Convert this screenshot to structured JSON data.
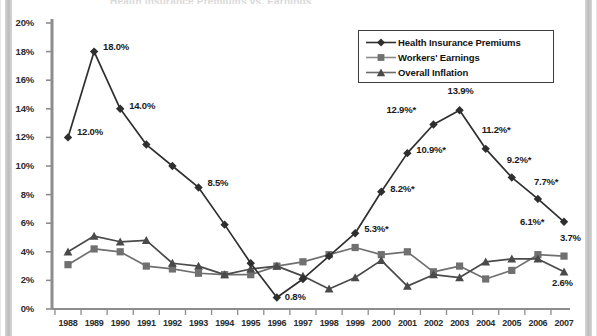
{
  "chart_data": {
    "type": "line",
    "title": "",
    "xlabel": "",
    "ylabel": "",
    "ylim": [
      0,
      20
    ],
    "ytick_labels": [
      "0%",
      "2%",
      "4%",
      "6%",
      "8%",
      "10%",
      "12%",
      "14%",
      "16%",
      "18%",
      "20%"
    ],
    "ytick_values": [
      0,
      2,
      4,
      6,
      8,
      10,
      12,
      14,
      16,
      18,
      20
    ],
    "grid": false,
    "legend_position": "top-right",
    "categories": [
      "1988",
      "1989",
      "1990",
      "1991",
      "1992",
      "1993",
      "1994",
      "1995",
      "1996",
      "1997",
      "1998",
      "1999",
      "2000",
      "2001",
      "2002",
      "2003",
      "2004",
      "2005",
      "2006",
      "2007"
    ],
    "series": [
      {
        "name": "Health Insurance Premiums",
        "marker": "diamond",
        "color": "#2f2f2f",
        "values": [
          12.0,
          18.0,
          14.0,
          11.5,
          10.0,
          8.5,
          5.9,
          3.2,
          0.8,
          2.1,
          3.7,
          5.3,
          8.2,
          10.9,
          12.9,
          13.9,
          11.2,
          9.2,
          7.7,
          6.1
        ],
        "labels": [
          {
            "x": "1988",
            "text": "12.0%"
          },
          {
            "x": "1989",
            "text": "18.0%"
          },
          {
            "x": "1990",
            "text": "14.0%"
          },
          {
            "x": "1993",
            "text": "8.5%"
          },
          {
            "x": "1996",
            "text": "0.8%"
          },
          {
            "x": "1999",
            "text": "5.3%*"
          },
          {
            "x": "2000",
            "text": "8.2%*"
          },
          {
            "x": "2001",
            "text": "10.9%*"
          },
          {
            "x": "2002",
            "text": "12.9%*"
          },
          {
            "x": "2003",
            "text": "13.9%"
          },
          {
            "x": "2004",
            "text": "11.2%*"
          },
          {
            "x": "2005",
            "text": "9.2%*"
          },
          {
            "x": "2006",
            "text": "7.7%*"
          },
          {
            "x": "2007",
            "text": "6.1%*"
          }
        ]
      },
      {
        "name": "Workers' Earnings",
        "marker": "square",
        "color": "#707070",
        "values": [
          3.1,
          4.2,
          4.0,
          3.0,
          2.8,
          2.5,
          2.4,
          2.4,
          3.0,
          3.3,
          3.8,
          4.3,
          3.8,
          4.0,
          2.6,
          3.0,
          2.1,
          2.7,
          3.8,
          3.7
        ],
        "labels": [
          {
            "x": "2007",
            "text": "3.7%"
          }
        ]
      },
      {
        "name": "Overall Inflation",
        "marker": "triangle",
        "color": "#4a4a4a",
        "values": [
          4.0,
          5.1,
          4.7,
          4.8,
          3.2,
          3.0,
          2.4,
          2.8,
          3.0,
          2.3,
          1.4,
          2.2,
          3.4,
          1.6,
          2.4,
          2.2,
          3.3,
          3.5,
          3.5,
          2.6
        ],
        "labels": [
          {
            "x": "2007",
            "text": "2.6%"
          }
        ]
      }
    ]
  },
  "legend": {
    "entries": [
      {
        "label": "Health Insurance Premiums",
        "marker": "diamond"
      },
      {
        "label": "Workers' Earnings",
        "marker": "square"
      },
      {
        "label": "Overall Inflation",
        "marker": "triangle"
      }
    ]
  },
  "title_ghost": "Health Insurance Premiums vs. Earnings"
}
